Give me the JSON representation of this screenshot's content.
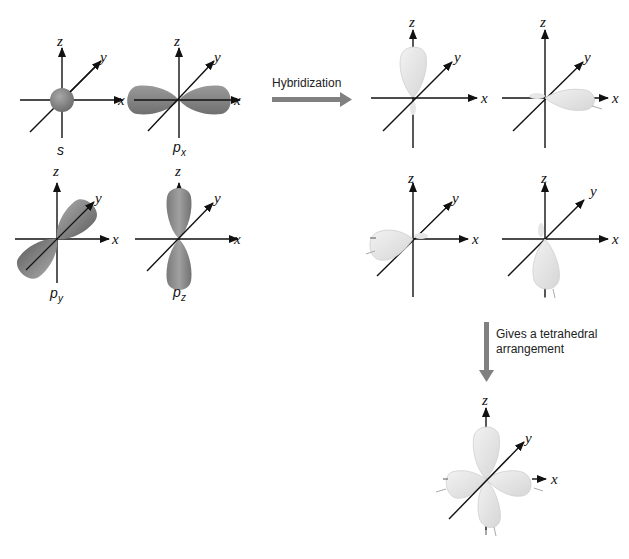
{
  "diagram": {
    "axis_labels": {
      "x": "x",
      "y": "y",
      "z": "z"
    },
    "colors": {
      "axis": "#111111",
      "pure_orbital": "#8c8c8c",
      "pure_orbital_dark": "#6e6e6e",
      "hybrid_orbital": "#e4e4e4",
      "hybrid_orbital_edge": "#c8c8c8",
      "arrow": "#808080"
    },
    "atomic_orbitals": [
      {
        "name": "s",
        "label": "s",
        "subscript": ""
      },
      {
        "name": "px",
        "label": "p",
        "subscript": "x"
      },
      {
        "name": "py",
        "label": "p",
        "subscript": "y"
      },
      {
        "name": "pz",
        "label": "p",
        "subscript": "z"
      }
    ],
    "hybrid_orbitals": [
      {
        "name": "sp3-1",
        "direction": "+z"
      },
      {
        "name": "sp3-2",
        "direction": "+x"
      },
      {
        "name": "sp3-3",
        "direction": "-x"
      },
      {
        "name": "sp3-4",
        "direction": "-z"
      }
    ],
    "steps": {
      "hybridization": "Hybridization",
      "tetrahedral_line1": "Gives a tetrahedral",
      "tetrahedral_line2": "arrangement"
    }
  }
}
